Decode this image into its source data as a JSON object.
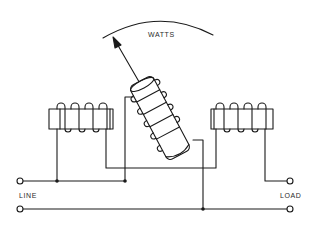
{
  "diagram": {
    "type": "wattmeter-schematic",
    "scale_label": "WATTS",
    "terminals": {
      "left_label": "LINE",
      "right_label": "LOAD"
    },
    "components": [
      {
        "id": "fixed-coil-left",
        "kind": "fixed current coil",
        "turns_shown": 4
      },
      {
        "id": "fixed-coil-right",
        "kind": "fixed current coil",
        "turns_shown": 4
      },
      {
        "id": "moving-coil",
        "kind": "movable voltage coil with pointer",
        "turns_shown": 4
      },
      {
        "id": "pointer",
        "kind": "indicator arrow pointing to WATTS scale"
      },
      {
        "id": "scale-arc",
        "kind": "meter scale arc"
      }
    ],
    "junctions": 3,
    "colors": {
      "line": "#1a1a1a",
      "background": "#ffffff"
    }
  }
}
